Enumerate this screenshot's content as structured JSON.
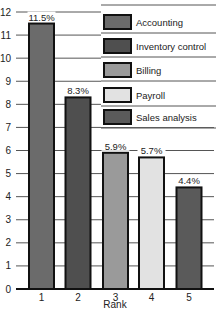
{
  "chart_data": {
    "type": "bar",
    "title": "",
    "xlabel": "Rank",
    "ylabel": "",
    "categories": [
      "1",
      "2",
      "3",
      "4",
      "5"
    ],
    "values": [
      11.5,
      8.3,
      5.9,
      5.7,
      4.4
    ],
    "data_labels": [
      "11.5%",
      "8.3%",
      "5.9%",
      "5.7%",
      "4.4%"
    ],
    "series_names": [
      "Accounting",
      "Inventory control",
      "Billing",
      "Payroll",
      "Sales analysis"
    ],
    "colors": [
      "#6b6b6b",
      "#4f4f4f",
      "#9a9a9a",
      "#e2e2e2",
      "#5a5a5a"
    ],
    "ylim": [
      0,
      12
    ],
    "yticks": [
      0,
      1,
      2,
      3,
      4,
      5,
      6,
      7,
      8,
      9,
      10,
      11,
      12
    ],
    "grid": true,
    "legend": {
      "position": "top-right",
      "entries": [
        "Accounting",
        "Inventory control",
        "Billing",
        "Payroll",
        "Sales analysis"
      ]
    }
  }
}
